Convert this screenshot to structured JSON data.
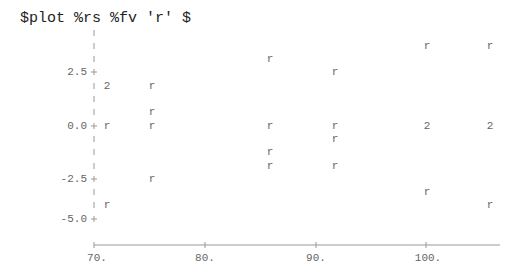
{
  "command": "$plot %rs %fv 'r' $",
  "chart_data": {
    "type": "scatter",
    "title": "$plot %rs %fv 'r' $",
    "xlabel": "fv",
    "ylabel": "rs",
    "marker": "r",
    "overlap_marker": "2",
    "x_ticks": [
      "70.",
      "80.",
      "90.",
      "100."
    ],
    "y_ticks": [
      "2.5",
      "0.0",
      "-2.5",
      "-5.0"
    ],
    "xlim": [
      69,
      107
    ],
    "ylim": [
      -5.0,
      4.3
    ],
    "grid": false,
    "points": [
      {
        "x": 71.2,
        "y": 1.9,
        "label": "2"
      },
      {
        "x": 71.2,
        "y": 0.0,
        "label": "r"
      },
      {
        "x": 71.2,
        "y": -3.8,
        "label": "r"
      },
      {
        "x": 75.3,
        "y": 1.9,
        "label": "r"
      },
      {
        "x": 75.3,
        "y": 0.6,
        "label": "r"
      },
      {
        "x": 75.3,
        "y": 0.0,
        "label": "r"
      },
      {
        "x": 75.3,
        "y": -2.5,
        "label": "r"
      },
      {
        "x": 85.8,
        "y": 3.1,
        "label": "r"
      },
      {
        "x": 85.8,
        "y": 0.0,
        "label": "r"
      },
      {
        "x": 85.8,
        "y": -1.2,
        "label": "r"
      },
      {
        "x": 85.8,
        "y": -1.8,
        "label": "r"
      },
      {
        "x": 91.7,
        "y": 2.5,
        "label": "r"
      },
      {
        "x": 91.7,
        "y": 0.0,
        "label": "r"
      },
      {
        "x": 91.7,
        "y": -0.6,
        "label": "r"
      },
      {
        "x": 91.7,
        "y": -1.8,
        "label": "r"
      },
      {
        "x": 100.0,
        "y": 3.7,
        "label": "r"
      },
      {
        "x": 100.0,
        "y": 0.0,
        "label": "2"
      },
      {
        "x": 100.0,
        "y": -3.1,
        "label": "r"
      },
      {
        "x": 105.8,
        "y": 3.7,
        "label": "r"
      },
      {
        "x": 105.8,
        "y": 0.0,
        "label": "2"
      },
      {
        "x": 105.8,
        "y": -3.8,
        "label": "r"
      }
    ]
  },
  "axis": {
    "y_labels": [
      {
        "text": "2.5",
        "y": 72
      },
      {
        "text": "0.0",
        "y": 126
      },
      {
        "text": "-2.5",
        "y": 179
      },
      {
        "text": "-5.0",
        "y": 219
      }
    ],
    "x_labels": [
      {
        "text": "70.",
        "x": 97
      },
      {
        "text": "80.",
        "x": 205
      },
      {
        "text": "90.",
        "x": 316
      },
      {
        "text": "100.",
        "x": 428
      }
    ]
  },
  "plot_points_px": [
    {
      "x": 107,
      "y": 86,
      "c": "2"
    },
    {
      "x": 107,
      "y": 126,
      "c": "r"
    },
    {
      "x": 107,
      "y": 205,
      "c": "r"
    },
    {
      "x": 152,
      "y": 86,
      "c": "r"
    },
    {
      "x": 152,
      "y": 112,
      "c": "r"
    },
    {
      "x": 152,
      "y": 126,
      "c": "r"
    },
    {
      "x": 152,
      "y": 179,
      "c": "r"
    },
    {
      "x": 270,
      "y": 59,
      "c": "r"
    },
    {
      "x": 270,
      "y": 126,
      "c": "r"
    },
    {
      "x": 270,
      "y": 152,
      "c": "r"
    },
    {
      "x": 270,
      "y": 166,
      "c": "r"
    },
    {
      "x": 335,
      "y": 72,
      "c": "r"
    },
    {
      "x": 335,
      "y": 126,
      "c": "r"
    },
    {
      "x": 335,
      "y": 139,
      "c": "r"
    },
    {
      "x": 335,
      "y": 166,
      "c": "r"
    },
    {
      "x": 427,
      "y": 46,
      "c": "r"
    },
    {
      "x": 427,
      "y": 126,
      "c": "2"
    },
    {
      "x": 427,
      "y": 192,
      "c": "r"
    },
    {
      "x": 490,
      "y": 46,
      "c": "r"
    },
    {
      "x": 490,
      "y": 126,
      "c": "2"
    },
    {
      "x": 490,
      "y": 205,
      "c": "r"
    }
  ]
}
